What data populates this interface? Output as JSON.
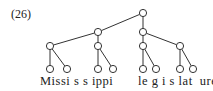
{
  "example_number": "(26)",
  "words": [
    {
      "text": "Missi s s ippi",
      "x": 40
    },
    {
      "text": "le g i s lat  ure",
      "x": 138
    }
  ],
  "tree": {
    "nodes": [
      {
        "id": "root",
        "x": 143,
        "y": 13
      },
      {
        "id": "w1",
        "x": 98,
        "y": 32
      },
      {
        "id": "w2",
        "x": 143,
        "y": 32
      },
      {
        "id": "f1",
        "x": 50,
        "y": 46
      },
      {
        "id": "f2",
        "x": 98,
        "y": 46
      },
      {
        "id": "f3",
        "x": 143,
        "y": 46
      },
      {
        "id": "f4",
        "x": 180,
        "y": 46
      },
      {
        "id": "l1",
        "x": 50,
        "y": 69
      },
      {
        "id": "l2",
        "x": 67,
        "y": 69
      },
      {
        "id": "l3",
        "x": 98,
        "y": 69
      },
      {
        "id": "l4",
        "x": 113,
        "y": 69
      },
      {
        "id": "l5",
        "x": 143,
        "y": 69
      },
      {
        "id": "l6",
        "x": 156,
        "y": 69
      },
      {
        "id": "l7",
        "x": 180,
        "y": 69
      },
      {
        "id": "l8",
        "x": 193,
        "y": 69
      }
    ],
    "edges": [
      [
        "root",
        "w1"
      ],
      [
        "root",
        "w2"
      ],
      [
        "w1",
        "f1"
      ],
      [
        "w1",
        "f2"
      ],
      [
        "w2",
        "f3"
      ],
      [
        "w2",
        "f4"
      ],
      [
        "f1",
        "l1"
      ],
      [
        "f1",
        "l2"
      ],
      [
        "f2",
        "l3"
      ],
      [
        "f2",
        "l4"
      ],
      [
        "f3",
        "l5"
      ],
      [
        "f3",
        "l6"
      ],
      [
        "f4",
        "l7"
      ],
      [
        "f4",
        "l8"
      ]
    ],
    "node_radius": 3.6,
    "stroke_color": "#333333"
  }
}
